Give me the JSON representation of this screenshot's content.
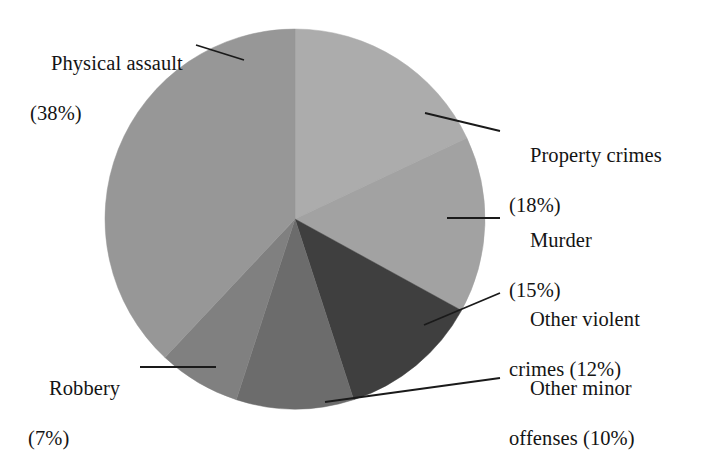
{
  "chart_data": {
    "type": "pie",
    "title": "",
    "subtitle": "",
    "xlabel": "",
    "ylabel": "",
    "legend_position": "none",
    "grid": false,
    "start_angle_deg": 0,
    "direction": "clockwise",
    "center": {
      "x": 295,
      "y": 219
    },
    "radius": 190,
    "categories": [
      "Property crimes",
      "Murder",
      "Other violent crimes",
      "Other minor offenses",
      "Robbery",
      "Physical assault"
    ],
    "values": [
      18,
      15,
      12,
      10,
      7,
      38
    ],
    "value_unit": "%",
    "slices": [
      {
        "name": "Property crimes",
        "value": 18,
        "percent_text": "(18%)",
        "label_line1": "Property crimes",
        "label_line2": "(18%)",
        "color": "#acacac",
        "start_deg": 0,
        "end_deg": 64.8
      },
      {
        "name": "Murder",
        "value": 15,
        "percent_text": "(15%)",
        "label_line1": "Murder",
        "label_line2": "(15%)",
        "color": "#a2a2a2",
        "start_deg": 64.8,
        "end_deg": 118.8
      },
      {
        "name": "Other violent crimes",
        "value": 12,
        "percent_text": "(12%)",
        "label_line1": "Other violent",
        "label_line2": "crimes (12%)",
        "color": "#3f3f3f",
        "start_deg": 118.8,
        "end_deg": 162.0
      },
      {
        "name": "Other minor offenses",
        "value": 10,
        "percent_text": "(10%)",
        "label_line1": "Other minor",
        "label_line2": "offenses (10%)",
        "color": "#6c6c6c",
        "start_deg": 162.0,
        "end_deg": 198.0
      },
      {
        "name": "Robbery",
        "value": 7,
        "percent_text": "(7%)",
        "label_line1": "Robbery",
        "label_line2": "(7%)",
        "color": "#808080",
        "start_deg": 198.0,
        "end_deg": 223.2
      },
      {
        "name": "Physical assault",
        "value": 38,
        "percent_text": "(38%)",
        "label_line1": "Physical assault",
        "label_line2": "(38%)",
        "color": "#979797",
        "start_deg": 223.2,
        "end_deg": 360.0
      }
    ],
    "leader_lines": [
      {
        "name": "physical-assault",
        "points": "196,45 244,60"
      },
      {
        "name": "property-crimes",
        "points": "425,113 500,131"
      },
      {
        "name": "murder",
        "points": "447,218 500,218"
      },
      {
        "name": "other-violent-crimes",
        "points": "424,325 500,293"
      },
      {
        "name": "other-minor-offenses",
        "points": "325,402 500,378"
      },
      {
        "name": "robbery",
        "points": "216,367 140,367"
      }
    ]
  },
  "labels": {
    "physical_assault": {
      "line1": "Physical assault",
      "line2": "(38%)"
    },
    "property_crimes": {
      "line1": "Property crimes",
      "line2": "(18%)"
    },
    "murder": {
      "line1": "Murder",
      "line2": "(15%)"
    },
    "other_violent_crimes": {
      "line1": "Other violent",
      "line2": "crimes (12%)"
    },
    "other_minor_offenses": {
      "line1": "Other minor",
      "line2": "offenses (10%)"
    },
    "robbery": {
      "line1": "Robbery",
      "line2": "(7%)"
    }
  },
  "colors": {
    "background": "#ffffff",
    "text": "#141414",
    "leader_line": "#1a1a1a"
  }
}
